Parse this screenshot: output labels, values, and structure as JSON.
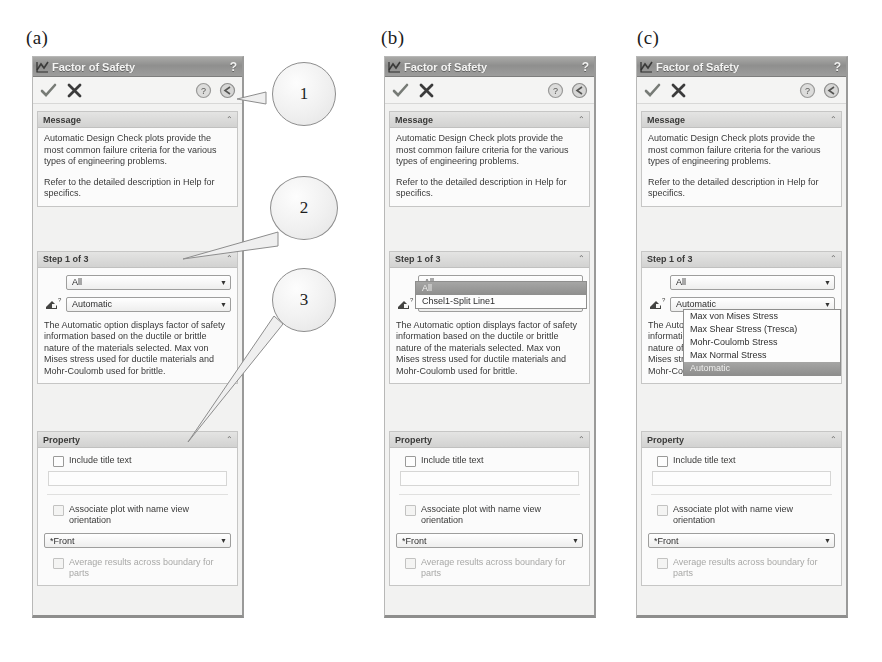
{
  "figure": {
    "panel_labels": [
      "(a)",
      "(b)",
      "(c)"
    ],
    "caption": ""
  },
  "dialog": {
    "title": "Factor of Safety",
    "help_glyph": "?",
    "title_icon": "fos-plot-icon",
    "toolbar": {
      "accept_icon": "green-check-icon",
      "cancel_icon": "red-x-icon",
      "help_icon": "help-circle-icon",
      "pin_icon": "back-circle-icon"
    },
    "message": {
      "header": "Message",
      "collapse_glyph": "⌃",
      "paragraphs": [
        "Automatic Design Check plots provide the most common failure criteria for the various types of engineering problems.",
        "Refer to the detailed description in Help for specifics."
      ]
    },
    "step": {
      "header": "Step 1 of 3",
      "collapse_glyph": "⌃",
      "selection_combo": {
        "name": "selection-combo",
        "value": "All",
        "options": [
          "All",
          "Chsel1-Split Line1"
        ]
      },
      "criterion_combo": {
        "name": "criterion-combo",
        "value": "Automatic",
        "icon": "criterion-icon",
        "options": [
          "Max von Mises Stress",
          "Max Shear Stress (Tresca)",
          "Mohr-Coulomb Stress",
          "Max Normal Stress",
          "Automatic"
        ],
        "selected_option": "Automatic"
      },
      "description": "The Automatic option displays factor of safety information based on the ductile or brittle nature of the materials selected. Max von Mises stress used for ductile materials and Mohr-Coulomb used for brittle."
    },
    "property": {
      "header": "Property",
      "collapse_glyph": "⌃",
      "include_title_text": {
        "label": "Include title text",
        "checked": false
      },
      "title_text_value": "",
      "associate_plot": {
        "label": "Associate plot with name view orientation",
        "checked": false
      },
      "view_combo": {
        "name": "view-orientation-combo",
        "value": "*Front"
      },
      "average_results": {
        "label": "Average results across boundary for parts",
        "checked": false,
        "disabled": true
      }
    }
  },
  "callouts": [
    {
      "number": "1",
      "target": "toolbar-pin-button"
    },
    {
      "number": "2",
      "target": "step-section-header"
    },
    {
      "number": "3",
      "target": "property-section-header"
    }
  ]
}
